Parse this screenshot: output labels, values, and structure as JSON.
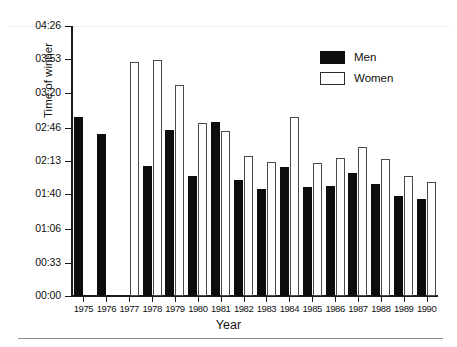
{
  "chart_data": {
    "type": "bar",
    "title": "",
    "xlabel": "Year",
    "ylabel": "Time of winner",
    "categories": [
      "1975",
      "1976",
      "1977",
      "1978",
      "1979",
      "1980",
      "1981",
      "1982",
      "1983",
      "1984",
      "1985",
      "1986",
      "1987",
      "1988",
      "1989",
      "1990"
    ],
    "series": [
      {
        "name": "Men",
        "color": "#0d0d0d",
        "values": [
          176,
          160,
          null,
          128,
          164,
          118,
          171,
          114,
          105,
          127,
          107,
          108,
          121,
          110,
          99,
          96
        ],
        "value_labels": [
          "02:56",
          "02:40",
          null,
          "02:08",
          "02:44",
          "01:58",
          "02:51",
          "01:54",
          "01:45",
          "02:07",
          "01:47",
          "01:48",
          "02:01",
          "01:50",
          "01:39",
          "01:36"
        ]
      },
      {
        "name": "Women",
        "color": "#ffffff",
        "values": [
          null,
          null,
          231,
          233,
          208,
          170,
          163,
          138,
          132,
          176,
          131,
          136,
          147,
          135,
          118,
          112
        ],
        "value_labels": [
          null,
          null,
          "03:51",
          "03:53",
          "03:28",
          "02:50",
          "02:43",
          "02:18",
          "02:12",
          "02:56",
          "02:11",
          "02:16",
          "02:27",
          "02:15",
          "01:58",
          "01:52"
        ]
      }
    ],
    "ylim": [
      0,
      266
    ],
    "yticks": [
      0,
      33,
      66,
      100,
      133,
      166,
      200,
      233,
      266
    ],
    "ytick_labels": [
      "00:00",
      "00:33",
      "01:06",
      "01:40",
      "02:13",
      "02:46",
      "03:20",
      "03:53",
      "04:26"
    ],
    "grid": false,
    "legend_position": "top-right",
    "y_units": "minutes",
    "note": "Bar heights are winner times in minutes; tick labels are h:mm."
  },
  "legend": {
    "items": [
      {
        "label": "Men",
        "style": "men"
      },
      {
        "label": "Women",
        "style": "women"
      }
    ]
  }
}
